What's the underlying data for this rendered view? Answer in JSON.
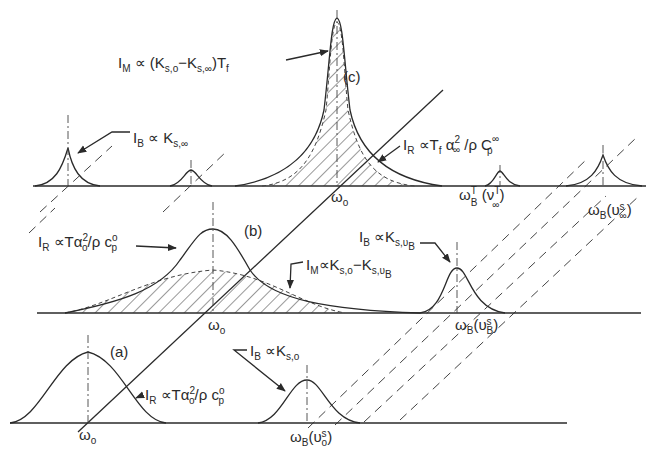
{
  "figure": {
    "panels": [
      {
        "id": "a",
        "label": "(a)"
      },
      {
        "id": "b",
        "label": "(b)"
      },
      {
        "id": "c",
        "label": "(c)"
      }
    ],
    "labels": {
      "c_IM": {
        "main": "I",
        "sub": "M",
        "rest": " ∝ (K",
        "s1": "s,o",
        "mid": "−K",
        "s2": "s,∞",
        "end": ")T",
        "s3": "f"
      },
      "c_IB": {
        "main": "I",
        "sub": "B",
        "rest": " ∝ K",
        "s1": "s,∞"
      },
      "c_IR": {
        "main": "I",
        "sub": "R",
        "rest": " ∝T",
        "s1": "f",
        "mid": " α",
        "sup1": "2",
        "s2": "∞",
        "end": " /ρ C",
        "sup2": "∞",
        "s3": "p"
      },
      "c_w0": {
        "main": "ω",
        "sub": "o"
      },
      "c_wBT": {
        "main": "ω",
        "sup": "T",
        "sub": "B",
        "rest": " (ν",
        "sup2": "T",
        "sub2": "∞",
        "end": ")"
      },
      "c_wBs": {
        "main": "ω",
        "sub": "B",
        "rest": "(υ",
        "sup": "s",
        "sub2": "∞",
        "end": ")"
      },
      "b_IR": {
        "main": "I",
        "sub": "R",
        "rest": " ∝Tα",
        "sup1": "2",
        "s1": "o",
        "end": "/ρ c",
        "sup2": "o",
        "s2": "p"
      },
      "b_IB": {
        "main": "I",
        "sub": "B",
        "rest": " ∝K",
        "s1": "s,υ",
        "s2": "B"
      },
      "b_IM": {
        "main": "I",
        "sub": "M",
        "rest": "∝K",
        "s1": "s,o",
        "mid": "−K",
        "s2": "s,υ",
        "s3": "B"
      },
      "b_w0": {
        "main": "ω",
        "sub": "o"
      },
      "b_wB": {
        "main": "ω",
        "sub": "B",
        "rest": "(υ",
        "sup": "s",
        "sub2": "B",
        "end": ")"
      },
      "a_IR": {
        "main": "I",
        "sub": "R",
        "rest": " ∝Tα",
        "sup1": "2",
        "s1": "o",
        "end": "/ρ c",
        "sup2": "o",
        "s2": "p"
      },
      "a_IB": {
        "main": "I",
        "sub": "B",
        "rest": " ∝K",
        "s1": "s,o"
      },
      "a_w0": {
        "main": "ω",
        "sub": "o"
      },
      "a_wB": {
        "main": "ω",
        "sub": "B",
        "rest": "(υ",
        "sup": "s",
        "sub2": "o",
        "end": ")"
      }
    }
  }
}
